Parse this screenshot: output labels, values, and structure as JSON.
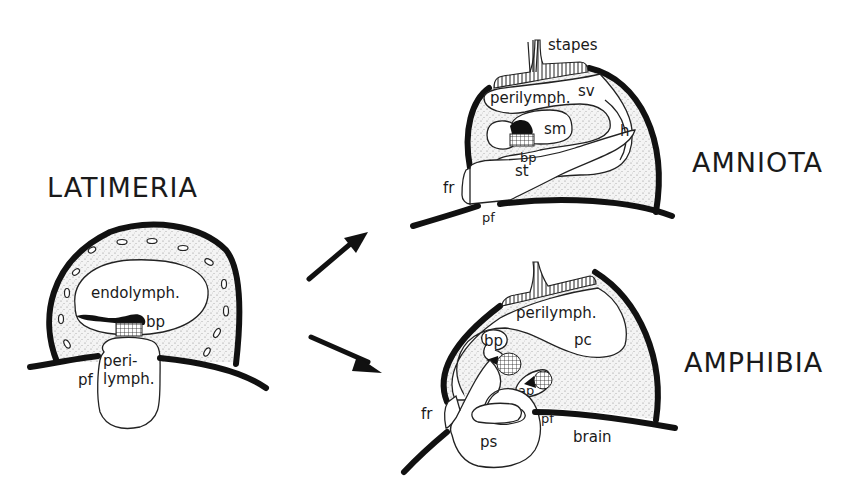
{
  "figure": {
    "panels": [
      {
        "id": "latimeria",
        "title": "LATIMERIA",
        "labels": {
          "endolymph": "endolymph.",
          "bp": "bp",
          "peri": "peri-",
          "lymph": "lymph.",
          "pf": "pf"
        }
      },
      {
        "id": "amniota",
        "title": "AMNIOTA",
        "labels": {
          "stapes": "stapes",
          "perilymph": "perilymph.",
          "sv": "sv",
          "sm": "sm",
          "h": "h",
          "bp": "bp",
          "st": "st",
          "fr": "fr",
          "pf": "pf"
        }
      },
      {
        "id": "amphibia",
        "title": "AMPHIBIA",
        "labels": {
          "perilymph": "perilymph.",
          "pc": "pc",
          "bp": "bp",
          "ap": "ap",
          "fr": "fr",
          "pf": "pf",
          "ps": "ps",
          "brain": "brain"
        }
      }
    ],
    "arrows": [
      {
        "from": "latimeria",
        "to": "amniota",
        "direction": "up-right"
      },
      {
        "from": "latimeria",
        "to": "amphibia",
        "direction": "down-right"
      }
    ],
    "colors": {
      "ink": "#111111",
      "background": "#ffffff",
      "stipple": "#9a9a9a"
    }
  }
}
